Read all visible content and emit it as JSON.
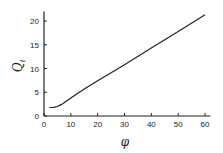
{
  "chart_data": {
    "type": "line",
    "title": "",
    "xlabel": "φ",
    "ylabel": "Q_i",
    "xlim": [
      0,
      62
    ],
    "ylim": [
      0,
      22
    ],
    "xticks": [
      0,
      10,
      20,
      30,
      40,
      50,
      60
    ],
    "yticks": [
      0,
      5,
      10,
      15,
      20
    ],
    "grid": false,
    "legend": null,
    "series": [
      {
        "name": "Q_i",
        "x": [
          2,
          3,
          4,
          5,
          6,
          7,
          8,
          10,
          15,
          20,
          30,
          40,
          50,
          60
        ],
        "y": [
          1.8,
          1.8,
          1.85,
          2.0,
          2.3,
          2.6,
          3.0,
          3.8,
          5.7,
          7.4,
          10.8,
          14.3,
          17.8,
          21.3
        ]
      }
    ]
  }
}
